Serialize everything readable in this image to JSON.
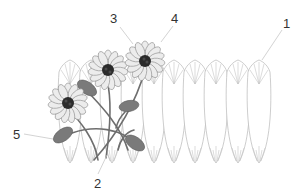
{
  "diagram": {
    "type": "botanical-illustration",
    "colors": {
      "background": "#ffffff",
      "petal_outline": "#b8b8b8",
      "flower_petal_fill": "#ececec",
      "flower_center": "#2b2b2b",
      "stem": "#6e6e6e",
      "bud": "#7a7a7a",
      "leader_line": "#c8c8c8",
      "label_text": "#333333"
    },
    "callouts": [
      {
        "id": "1",
        "label": "1",
        "target": "elongated-petal"
      },
      {
        "id": "2",
        "label": "2",
        "target": "stem"
      },
      {
        "id": "3",
        "label": "3",
        "target": "flower-head"
      },
      {
        "id": "4",
        "label": "4",
        "target": "flower-head"
      },
      {
        "id": "5",
        "label": "5",
        "target": "bud"
      }
    ],
    "petal_row_count": 10,
    "flower_count": 3,
    "bud_count": 4
  }
}
